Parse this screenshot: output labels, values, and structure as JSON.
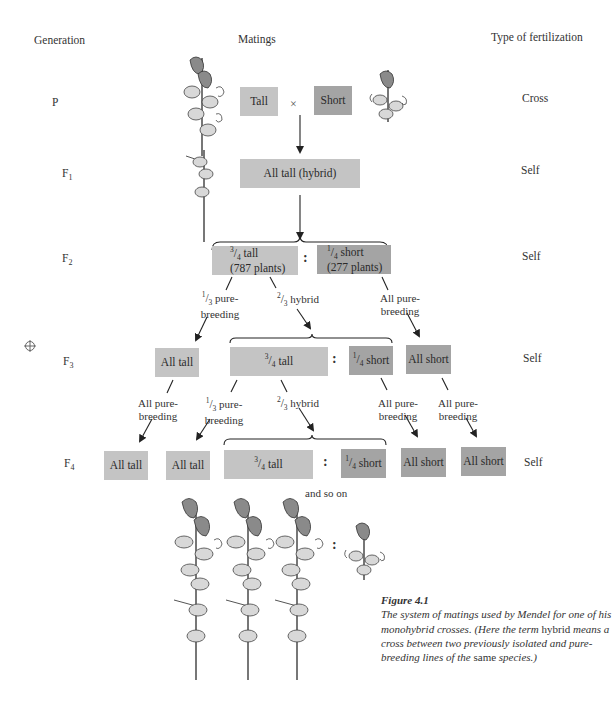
{
  "headers": {
    "generation": "Generation",
    "matings": "Matings",
    "fertilization": "Type of fertilization"
  },
  "generations": [
    {
      "letter": "P",
      "sub": "",
      "fertilization": "Cross"
    },
    {
      "letter": "F",
      "sub": "1",
      "fertilization": "Self"
    },
    {
      "letter": "F",
      "sub": "2",
      "fertilization": "Self"
    },
    {
      "letter": "F",
      "sub": "3",
      "fertilization": "Self"
    },
    {
      "letter": "F",
      "sub": "4",
      "fertilization": "Self"
    }
  ],
  "p_row": {
    "tall": "Tall",
    "cross_symbol": "×",
    "short": "Short"
  },
  "f1_row": {
    "box": "All tall (hybrid)"
  },
  "f2_row": {
    "tall_num": "3",
    "tall_den": "4",
    "tall_text": "tall",
    "tall_count": "(787 plants)",
    "separator": ":",
    "short_num": "1",
    "short_den": "4",
    "short_text": "short",
    "short_count": "(277 plants)"
  },
  "f2_to_f3_labels": {
    "pure_num": "1",
    "pure_den": "3",
    "pure_line1": "pure-",
    "pure_line2": "breeding",
    "hybrid_num": "2",
    "hybrid_den": "3",
    "hybrid_text": "hybrid",
    "allpure_line1": "All pure-",
    "allpure_line2": "breeding"
  },
  "f3_row": {
    "all_tall": "All tall",
    "tall_num": "3",
    "tall_den": "4",
    "tall_text": "tall",
    "separator": ":",
    "short_num": "1",
    "short_den": "4",
    "short_text": "short",
    "all_short": "All short"
  },
  "f3_to_f4_labels": {
    "allpure_a_line1": "All pure-",
    "allpure_a_line2": "breeding",
    "pure_num": "1",
    "pure_den": "3",
    "pure_line1": "pure-",
    "pure_line2": "breeding",
    "hybrid_num": "2",
    "hybrid_den": "3",
    "hybrid_text": "hybrid",
    "allpure_b_line1": "All pure-",
    "allpure_b_line2": "breeding",
    "allpure_c_line1": "All pure-",
    "allpure_c_line2": "breeding"
  },
  "f4_row": {
    "all_tall_1": "All tall",
    "all_tall_2": "All tall",
    "tall_num": "3",
    "tall_den": "4",
    "tall_text": "tall",
    "separator": ":",
    "short_num": "1",
    "short_den": "4",
    "short_text": "short",
    "all_short_1": "All short",
    "all_short_2": "All short"
  },
  "continuation": "and so on",
  "bottom_ratio_separator": ":",
  "caption": {
    "title": "Figure 4.1",
    "text_before": "The system of matings used by Mendel for one of his monohybrid crosses. (Here the term ",
    "term": "hybrid",
    "text_middle": " means a cross between two previously isolated and pure-breeding lines of the ",
    "same": "same",
    "text_after": " species.)"
  },
  "colors": {
    "tall_box": "#c4c4c4",
    "short_box": "#a4a4a4",
    "text": "#2a2a2a",
    "arrow": "#222222"
  }
}
